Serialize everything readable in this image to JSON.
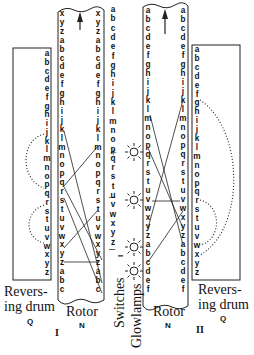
{
  "diagram": {
    "type": "enigma-rotor-wiring",
    "labels": {
      "left_drum": [
        "Revers-",
        "ing drum"
      ],
      "left_drum_code": "Q",
      "rotor_left": "Rotor",
      "rotor_left_code": "N",
      "switches": "Switches",
      "switches_code": "I",
      "glowlamps": "Glowlamps",
      "rotor_right": "Rotor",
      "rotor_right_code": "N",
      "right_drum": [
        "Revers-",
        "ing drum"
      ],
      "right_drum_code": "Q",
      "roman_left": "I",
      "roman_right": "II"
    },
    "symbols": {
      "plus": "+",
      "minus_1": "–",
      "minus_2": "–",
      "up_arrow": "arrow-up",
      "lamp": "glowlamp"
    },
    "columns": {
      "left_drum": [
        "a",
        "b",
        "c",
        "d",
        "e",
        "f",
        "g",
        "h",
        "i",
        "j",
        "k",
        "l",
        "m",
        "n",
        "o",
        "p",
        "q",
        "r",
        "s",
        "t",
        "u",
        "v",
        "w",
        "x",
        "y",
        "z"
      ],
      "rotor1_left": [
        "x",
        "y",
        "z",
        "a",
        "b",
        "c",
        "d",
        "e",
        "f",
        "g",
        "h",
        "i",
        "j",
        "k",
        "l",
        "m",
        "n",
        "o",
        "p",
        "q",
        "r",
        "s",
        "t",
        "u",
        "v",
        "w",
        "x",
        "y",
        "z",
        "a",
        "b",
        "c"
      ],
      "rotor1_right": [
        "x",
        "y",
        "z",
        "a",
        "b",
        "c",
        "d",
        "e",
        "f",
        "g",
        "h",
        "i",
        "j",
        "k",
        "l",
        "m",
        "n",
        "o",
        "p",
        "q",
        "r",
        "s",
        "t",
        "u",
        "v",
        "w",
        "x",
        "y",
        "z",
        "a",
        "b",
        "c"
      ],
      "center": [
        "a",
        "b",
        "c",
        "d",
        "e",
        "f",
        "g",
        "h",
        "i",
        "j",
        "k",
        "l",
        "m",
        "n",
        "o",
        "p",
        "q",
        "r",
        "s",
        "t",
        "u",
        "v",
        "w",
        "x",
        "y",
        "z"
      ],
      "rotor2_left": [
        "a",
        "b",
        "c",
        "d",
        "e",
        "f",
        "g",
        "h",
        "i",
        "j",
        "k",
        "l",
        "m",
        "n",
        "o",
        "p",
        "q",
        "r",
        "s",
        "t",
        "u",
        "v",
        "w",
        "x",
        "y",
        "z",
        "a",
        "b",
        "c",
        "d",
        "e",
        "f"
      ],
      "rotor2_right": [
        "a",
        "b",
        "c",
        "d",
        "e",
        "f",
        "g",
        "h",
        "i",
        "j",
        "k",
        "l",
        "m",
        "n",
        "o",
        "p",
        "q",
        "r",
        "s",
        "t",
        "u",
        "v",
        "w",
        "x",
        "y",
        "z",
        "a",
        "b",
        "c",
        "d",
        "e",
        "f"
      ],
      "right_drum": [
        "a",
        "b",
        "c",
        "d",
        "e",
        "f",
        "g",
        "h",
        "i",
        "j",
        "k",
        "l",
        "m",
        "n",
        "o",
        "p",
        "q",
        "r",
        "s",
        "t",
        "u",
        "v",
        "w",
        "x",
        "y",
        "z"
      ]
    }
  }
}
